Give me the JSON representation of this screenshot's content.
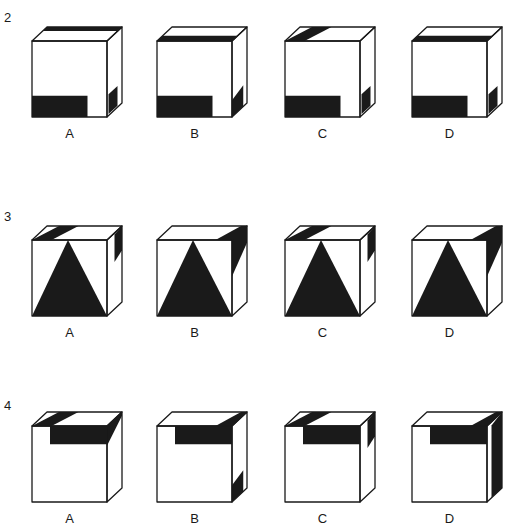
{
  "colors": {
    "ink": "#1a1a1a",
    "paper": "#ffffff"
  },
  "rows": [
    {
      "number": "2",
      "options": [
        {
          "label": "A",
          "top": "back-band",
          "front": "bottom-left-bar",
          "side": "bottom-mid-block"
        },
        {
          "label": "B",
          "top": "front-band",
          "front": "bottom-left-bar",
          "side": "bottom-block"
        },
        {
          "label": "C",
          "top": "left-corner-block",
          "front": "bottom-left-bar",
          "side": "bottom-mid-block"
        },
        {
          "label": "D",
          "top": "front-band",
          "front": "bottom-left-bar",
          "side": "bottom-mid-block"
        }
      ]
    },
    {
      "number": "3",
      "options": [
        {
          "label": "A",
          "top": "left-corner-block",
          "front": "triangle",
          "side": "top-block"
        },
        {
          "label": "B",
          "top": "right-corner-block",
          "front": "triangle",
          "side": "top-right-wedge"
        },
        {
          "label": "C",
          "top": "left-corner-block",
          "front": "triangle",
          "side": "top-block"
        },
        {
          "label": "D",
          "top": "right-corner-block",
          "front": "triangle",
          "side": "top-right-wedge"
        }
      ]
    },
    {
      "number": "4",
      "options": [
        {
          "label": "A",
          "top": "left-corner-block",
          "front": "top-right-notch",
          "side": "top-wedge"
        },
        {
          "label": "B",
          "top": "right-corner-block",
          "front": "top-right-notch",
          "side": "bottom-block"
        },
        {
          "label": "C",
          "top": "left-corner-block",
          "front": "top-right-notch",
          "side": "top-block"
        },
        {
          "label": "D",
          "top": "right-corner-block",
          "front": "top-right-notch",
          "side": "full-strip"
        }
      ]
    }
  ]
}
